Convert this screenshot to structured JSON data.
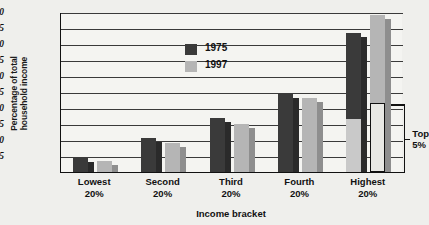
{
  "chart_data": {
    "type": "bar",
    "title": "",
    "xlabel": "Income bracket",
    "ylabel": "Percentage of total household income",
    "ylabel_lines": [
      "Percentage of total",
      "household income"
    ],
    "categories": [
      "Lowest\n20%",
      "Second\n20%",
      "Third\n20%",
      "Fourth\n20%",
      "Highest\n20%"
    ],
    "category_lines": [
      [
        "Lowest",
        "20%"
      ],
      [
        "Second",
        "20%"
      ],
      [
        "Third",
        "20%"
      ],
      [
        "Fourth",
        "20%"
      ],
      [
        "Highest",
        "20%"
      ]
    ],
    "series": [
      {
        "name": "1975",
        "color": "#3a3a3a",
        "values": [
          4.5,
          10.5,
          17.0,
          24.5,
          43.5
        ]
      },
      {
        "name": "1997",
        "color": "#b5b5b5",
        "values": [
          3.5,
          9.0,
          15.0,
          23.0,
          49.0
        ]
      }
    ],
    "top5_segment": {
      "label_lines": [
        "Top",
        "5%"
      ],
      "label": "Top 5%",
      "values": {
        "1975": 16.5,
        "1997": 21.5
      },
      "applies_to_category": "Highest 20%"
    },
    "ylim": [
      0,
      50
    ],
    "yticks": [
      5,
      10,
      15,
      20,
      25,
      30,
      35,
      40,
      45,
      50
    ],
    "ytick_labels": [
      "5",
      "10",
      "15",
      "20",
      "25",
      "30",
      "35",
      "40",
      "45",
      "50"
    ],
    "grid": true,
    "legend_position": "upper-left-inside",
    "legend_entries": [
      "1975",
      "1997"
    ]
  },
  "colors": {
    "bar_1975_front": "#3a3a3a",
    "bar_1975_side": "#2a2a2a",
    "bar_1997_front": "#b5b5b5",
    "bar_1997_side": "#8e8e8e",
    "top5_1975": "#c9c9c9",
    "top5_1997": "#e8e8e4",
    "axis": "#111111",
    "grid": "#3a3a3a",
    "plot_bg": "#f4f4f1",
    "page_bg": "#efefec"
  }
}
